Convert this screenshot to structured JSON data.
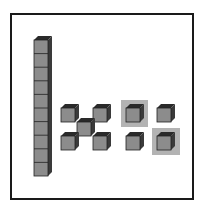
{
  "diagram": {
    "type": "base-ten-blocks",
    "colors": {
      "frame": "#1a1a1a",
      "cube_face": "#8c8c8c",
      "cube_top": "#2a2a2a",
      "cube_side": "#3a3a3a",
      "highlight": "#b3b3b3"
    },
    "tens_rods": [
      {
        "units": 10
      }
    ],
    "ones_groups": [
      {
        "name": "x-pattern",
        "count": 5
      },
      {
        "name": "square-pattern",
        "count": 4,
        "highlighted": 2
      }
    ]
  }
}
